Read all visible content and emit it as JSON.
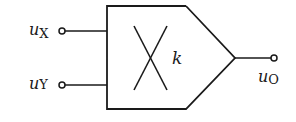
{
  "diagram": {
    "type": "analog multiplier symbol",
    "block_label": "k",
    "inputs": [
      {
        "symbol": "u",
        "subscript": "X"
      },
      {
        "symbol": "u",
        "subscript": "Y"
      }
    ],
    "output": {
      "symbol": "u",
      "subscript": "O"
    },
    "stroke_color": "#1a1a1a"
  }
}
